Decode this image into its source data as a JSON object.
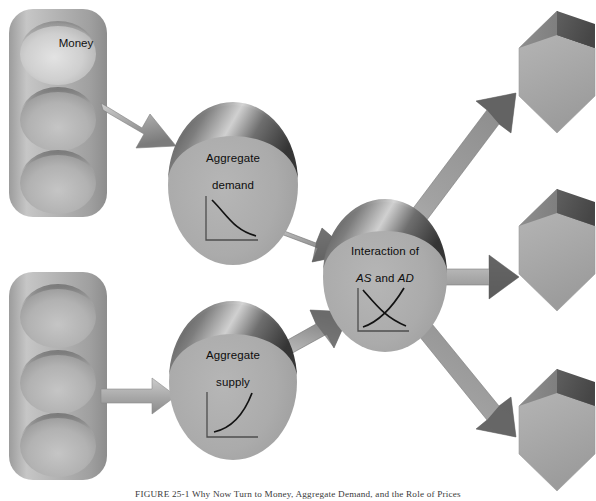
{
  "figure": {
    "background_color": "#ffffff",
    "caption": "FIGURE 25-1   Why Now Turn to Money, Aggregate Demand, and the Role of Prices",
    "caption_label": "FIGURE 25-1"
  },
  "palette": {
    "body_gray": "#a8a8a8",
    "light_gray": "#c8c8c8",
    "mid_gray": "#9a9a9a",
    "dark_gray": "#4a4a4a",
    "shadow_gray": "#6e6e6e",
    "highlight": "#d8d8d8",
    "curve_ink": "#1a1a1a",
    "axis_ink": "#4d4d4d",
    "text_ink": "#111111"
  },
  "inputs": [
    {
      "name": "money-stack",
      "slots": [
        {
          "label": "Money",
          "highlighted": true
        },
        {
          "label": "",
          "highlighted": false
        },
        {
          "label": "",
          "highlighted": false
        }
      ]
    },
    {
      "name": "supply-stack",
      "slots": [
        {
          "label": "",
          "highlighted": false
        },
        {
          "label": "",
          "highlighted": false
        },
        {
          "label": "",
          "highlighted": false
        }
      ]
    }
  ],
  "nodes": [
    {
      "id": "aggregate-demand",
      "label_line1": "Aggregate",
      "label_line2": "demand",
      "thumbnail": "downward-sloping-demand-curve"
    },
    {
      "id": "aggregate-supply",
      "label_line1": "Aggregate",
      "label_line2": "supply",
      "thumbnail": "upward-sloping-supply-curve"
    },
    {
      "id": "as-ad-interaction",
      "label_line1": "Interaction of",
      "label_prefix": "AS",
      "label_middle": " and ",
      "label_suffix": "AD",
      "thumbnail": "crossing-supply-demand-curves"
    }
  ],
  "outputs": [
    {
      "id": "outcome-top",
      "label": ""
    },
    {
      "id": "outcome-middle",
      "label": ""
    },
    {
      "id": "outcome-bottom",
      "label": ""
    }
  ],
  "arrows": [
    {
      "id": "money-to-demand",
      "from": "money-stack",
      "to": "aggregate-demand",
      "direction": "down-right"
    },
    {
      "id": "supply-stack-to-supply",
      "from": "supply-stack",
      "to": "aggregate-supply",
      "direction": "right"
    },
    {
      "id": "demand-to-interaction",
      "from": "aggregate-demand",
      "to": "as-ad-interaction",
      "direction": "down-right"
    },
    {
      "id": "supply-to-interaction",
      "from": "aggregate-supply",
      "to": "as-ad-interaction",
      "direction": "up-right"
    },
    {
      "id": "interaction-to-top",
      "from": "as-ad-interaction",
      "to": "outcome-top",
      "direction": "up-right"
    },
    {
      "id": "interaction-to-middle",
      "from": "as-ad-interaction",
      "to": "outcome-middle",
      "direction": "right"
    },
    {
      "id": "interaction-to-bottom",
      "from": "as-ad-interaction",
      "to": "outcome-bottom",
      "direction": "down-right"
    }
  ]
}
